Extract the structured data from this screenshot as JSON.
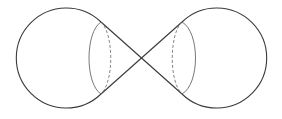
{
  "figure": {
    "colors": {
      "background": "#ffffff",
      "line": "#3a3a3a",
      "hidden_line": "#666666"
    },
    "apex": {
      "x": 141,
      "y": 58
    },
    "left_sphere": {
      "center": {
        "x": 67,
        "y": 58
      },
      "radius": 50,
      "tangent_top": {
        "x": 101,
        "y": 22
      },
      "tangent_bottom": {
        "x": 101,
        "y": 94
      },
      "ellipse_visible_x": 88,
      "ellipse_hidden_x": 111
    },
    "right_sphere": {
      "center": {
        "x": 216,
        "y": 58
      },
      "radius": 50,
      "tangent_top": {
        "x": 182,
        "y": 22
      },
      "tangent_bottom": {
        "x": 182,
        "y": 94
      },
      "ellipse_visible_x": 197,
      "ellipse_hidden_x": 173
    }
  }
}
